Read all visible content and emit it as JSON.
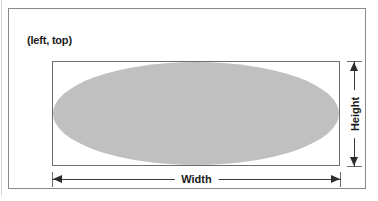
{
  "figure": {
    "corner_label": "(left, top)",
    "width_label": "Width",
    "height_label": "Height",
    "colors": {
      "ellipse_fill": "#c0c0c0",
      "frame_border": "#8a8a8a",
      "box_border": "#6e6e6e",
      "dimension_line": "#3a3a3a",
      "arrowhead": "#2b2b2b",
      "text": "#1a1a1a",
      "background": "#ffffff"
    },
    "shape": {
      "type": "ellipse",
      "inscribed_in": "bounding-box"
    },
    "dimensions": [
      {
        "name": "Width",
        "orientation": "horizontal",
        "position": "below"
      },
      {
        "name": "Height",
        "orientation": "vertical",
        "position": "right"
      }
    ],
    "anchor_point": {
      "name": "(left, top)",
      "position": "upper-left"
    }
  }
}
